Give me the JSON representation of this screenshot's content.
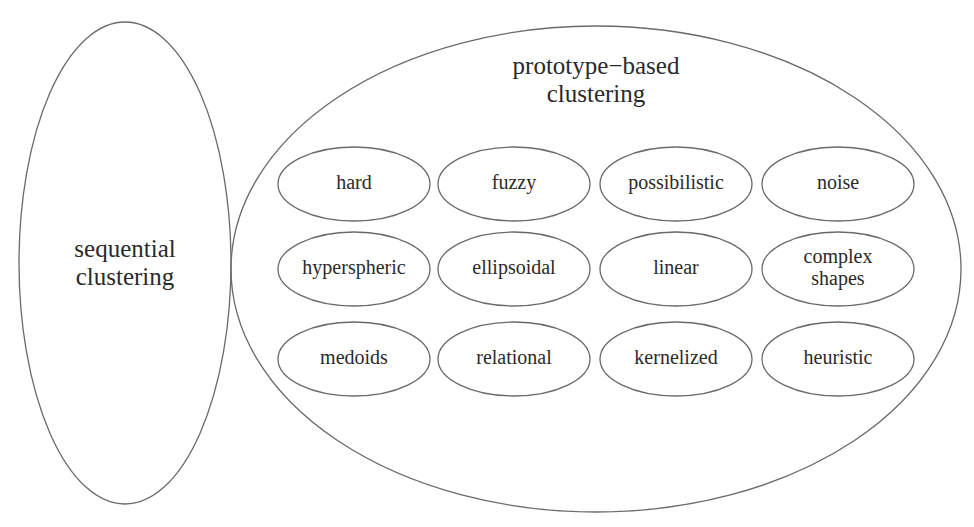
{
  "diagram": {
    "left_group": {
      "label_lines": [
        "sequential",
        "clustering"
      ],
      "shape": {
        "cx": 125,
        "cy": 263,
        "rx": 106,
        "ry": 241
      }
    },
    "right_group": {
      "label_lines": [
        "prototype−based",
        "clustering"
      ],
      "shape": {
        "cx": 596,
        "cy": 269,
        "rx": 365,
        "ry": 243
      },
      "rows": [
        {
          "y": 184,
          "items": [
            {
              "label_lines": [
                "hard"
              ],
              "cx": 354
            },
            {
              "label_lines": [
                "fuzzy"
              ],
              "cx": 514
            },
            {
              "label_lines": [
                "possibilistic"
              ],
              "cx": 676
            },
            {
              "label_lines": [
                "noise"
              ],
              "cx": 838
            }
          ]
        },
        {
          "y": 269,
          "items": [
            {
              "label_lines": [
                "hyperspheric"
              ],
              "cx": 354
            },
            {
              "label_lines": [
                "ellipsoidal"
              ],
              "cx": 514
            },
            {
              "label_lines": [
                "linear"
              ],
              "cx": 676
            },
            {
              "label_lines": [
                "complex",
                "shapes"
              ],
              "cx": 838
            }
          ]
        },
        {
          "y": 359,
          "items": [
            {
              "label_lines": [
                "medoids"
              ],
              "cx": 354
            },
            {
              "label_lines": [
                "relational"
              ],
              "cx": 514
            },
            {
              "label_lines": [
                "kernelized"
              ],
              "cx": 676
            },
            {
              "label_lines": [
                "heuristic"
              ],
              "cx": 838
            }
          ]
        }
      ],
      "item_shape": {
        "rx": 76,
        "ry": 37
      }
    },
    "colors": {
      "stroke": "#6a6a6a",
      "text": "#2a2a2a",
      "background": "#ffffff"
    }
  }
}
